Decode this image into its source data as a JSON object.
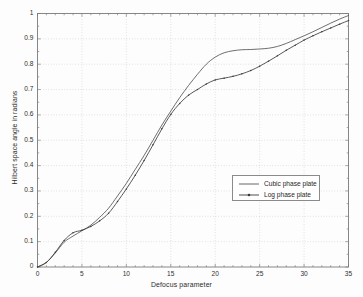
{
  "chart_data": {
    "type": "line",
    "title": "",
    "xlabel": "Defocus parameter",
    "ylabel": "Hilbert space angle in radians",
    "xlim": [
      0,
      35
    ],
    "ylim": [
      0,
      1
    ],
    "xticks": [
      "0",
      "5",
      "10",
      "15",
      "20",
      "25",
      "30",
      "35"
    ],
    "xtick_values": [
      0,
      5,
      10,
      15,
      20,
      25,
      30,
      35
    ],
    "yticks": [
      "0",
      "0.1",
      "0.2",
      "0.3",
      "0.4",
      "0.5",
      "0.6",
      "0.7",
      "0.8",
      "0.9",
      "1"
    ],
    "ytick_values": [
      0,
      0.1,
      0.2,
      0.3,
      0.4,
      0.5,
      0.6,
      0.7,
      0.8,
      0.9,
      1
    ],
    "grid": true,
    "grid_style": "dotted",
    "legend_position": "center-right",
    "x": [
      0,
      1,
      2,
      3,
      4,
      5,
      6,
      7,
      8,
      9,
      10,
      11,
      12,
      13,
      14,
      15,
      16,
      17,
      18,
      19,
      20,
      21,
      22,
      23,
      24,
      25,
      26,
      27,
      28,
      29,
      30,
      31,
      32,
      33,
      34,
      35
    ],
    "series": [
      {
        "name": "Cubic phase plate",
        "style": "solid",
        "marker": "none",
        "color": "#555555",
        "values": [
          0.0,
          0.018,
          0.055,
          0.098,
          0.122,
          0.143,
          0.165,
          0.196,
          0.232,
          0.28,
          0.33,
          0.385,
          0.44,
          0.5,
          0.56,
          0.615,
          0.668,
          0.716,
          0.76,
          0.8,
          0.828,
          0.845,
          0.853,
          0.857,
          0.858,
          0.86,
          0.863,
          0.87,
          0.882,
          0.897,
          0.912,
          0.928,
          0.945,
          0.962,
          0.978,
          0.992
        ]
      },
      {
        "name": "Log phase plate",
        "style": "solid-with-markers",
        "marker": "dot",
        "color": "#3b3b3b",
        "values": [
          0.0,
          0.018,
          0.058,
          0.105,
          0.135,
          0.145,
          0.16,
          0.182,
          0.212,
          0.258,
          0.308,
          0.362,
          0.42,
          0.482,
          0.545,
          0.602,
          0.645,
          0.678,
          0.7,
          0.722,
          0.738,
          0.745,
          0.752,
          0.762,
          0.775,
          0.792,
          0.812,
          0.833,
          0.855,
          0.875,
          0.895,
          0.912,
          0.928,
          0.943,
          0.958,
          0.972
        ]
      }
    ]
  },
  "legend": {
    "entries": [
      {
        "label": "Cubic phase plate"
      },
      {
        "label": "Log phase plate"
      }
    ]
  }
}
